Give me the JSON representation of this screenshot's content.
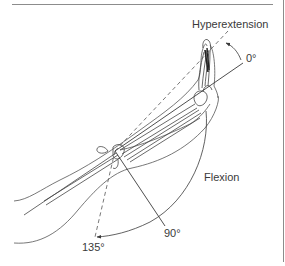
{
  "figure": {
    "labels": {
      "hyperextension": "Hyperextension",
      "zero": "0°",
      "flexion": "Flexion",
      "ninety": "90°",
      "one_thirty_five": "135°"
    },
    "angles": [
      {
        "name": "Hyperextension",
        "type": "dashed-reference"
      },
      {
        "name": "0°",
        "type": "solid-reference"
      },
      {
        "name": "90°",
        "type": "solid-reference"
      },
      {
        "name": "135°",
        "type": "dashed-reference"
      }
    ],
    "colors": {
      "line": "#3a3a3a",
      "rule": "#8c8c8c",
      "background": "#ffffff"
    }
  }
}
